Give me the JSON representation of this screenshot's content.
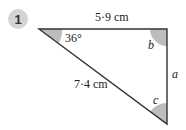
{
  "question": {
    "number": "1",
    "badge_color": "#d4d4d4"
  },
  "triangle": {
    "stroke_color": "#333333",
    "angle_fill": "#bdbdbd",
    "vertices": {
      "top_left": [
        39,
        29
      ],
      "top_right": [
        167,
        29
      ],
      "bottom": [
        167,
        124
      ]
    },
    "sides": {
      "top": "5·9 cm",
      "hypotenuse": "7·4 cm",
      "right": "a"
    },
    "angles": {
      "top_left": "36°",
      "top_right": "b",
      "bottom": "c"
    }
  }
}
